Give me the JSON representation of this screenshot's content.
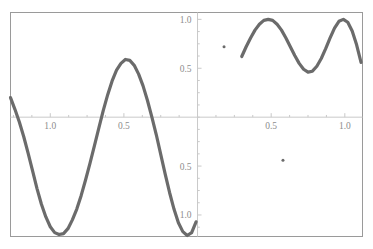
{
  "chart_data": {
    "type": "line",
    "title": "",
    "subtitle": "",
    "xlabel": "",
    "ylabel": "",
    "xlim": [
      -1.27,
      1.12
    ],
    "ylim": [
      -1.22,
      1.07
    ],
    "grid": false,
    "legend": null,
    "legend_position": "none",
    "axes": {
      "style": "cross-axes-inside-frame",
      "frame": true,
      "frame_color": "#9a9a9a",
      "axis_color": "#c9c9c9",
      "x_axis_value": 0,
      "y_axis_value": 0,
      "x_ticks": [
        -1.0,
        -0.5,
        0.5,
        1.0
      ],
      "x_tick_labels": [
        "1.0",
        "0.5",
        "0.5",
        "1.0"
      ],
      "y_ticks": [
        -1.0,
        -0.5,
        0.5,
        1.0
      ],
      "y_tick_labels": [
        "1.0",
        "0.5",
        "0.5",
        "1.0"
      ],
      "minor_ticks_per_interval": 4
    },
    "series": [
      {
        "name": "main-branch",
        "color": "#6b6b6b",
        "linewidth": 3.2,
        "x": [
          -1.27,
          -1.24,
          -1.21,
          -1.18,
          -1.15,
          -1.12,
          -1.09,
          -1.06,
          -1.03,
          -1.0,
          -0.97,
          -0.94,
          -0.91,
          -0.88,
          -0.85,
          -0.82,
          -0.79,
          -0.76,
          -0.73,
          -0.7,
          -0.67,
          -0.64,
          -0.61,
          -0.58,
          -0.55,
          -0.52,
          -0.49,
          -0.46,
          -0.43,
          -0.4,
          -0.37,
          -0.34,
          -0.31,
          -0.28,
          -0.25,
          -0.22,
          -0.19,
          -0.16,
          -0.13,
          -0.1,
          -0.07,
          -0.04,
          -0.01
        ],
        "y": [
          0.2,
          0.08,
          -0.05,
          -0.2,
          -0.37,
          -0.55,
          -0.73,
          -0.89,
          -1.02,
          -1.12,
          -1.18,
          -1.2,
          -1.19,
          -1.14,
          -1.05,
          -0.94,
          -0.8,
          -0.64,
          -0.47,
          -0.29,
          -0.11,
          0.07,
          0.23,
          0.37,
          0.48,
          0.55,
          0.59,
          0.58,
          0.53,
          0.44,
          0.32,
          0.17,
          0.0,
          -0.18,
          -0.38,
          -0.58,
          -0.77,
          -0.94,
          -1.08,
          -1.17,
          -1.21,
          -1.18,
          -1.07
        ]
      },
      {
        "name": "upper-right-branch",
        "color": "#6b6b6b",
        "linewidth": 3.2,
        "x": [
          0.3,
          0.33,
          0.36,
          0.39,
          0.42,
          0.45,
          0.48,
          0.51,
          0.54,
          0.57,
          0.6,
          0.63,
          0.66,
          0.69,
          0.72,
          0.75,
          0.78,
          0.81,
          0.84,
          0.87,
          0.9,
          0.93,
          0.96,
          0.99,
          1.02,
          1.05,
          1.08,
          1.11
        ],
        "y": [
          0.62,
          0.72,
          0.81,
          0.89,
          0.95,
          0.99,
          1.0,
          0.99,
          0.95,
          0.89,
          0.81,
          0.72,
          0.63,
          0.55,
          0.49,
          0.46,
          0.47,
          0.52,
          0.6,
          0.7,
          0.81,
          0.91,
          0.98,
          1.0,
          0.97,
          0.88,
          0.74,
          0.56
        ]
      }
    ],
    "points": [
      {
        "name": "isolated-point-1",
        "x": 0.18,
        "y": 0.72,
        "color": "#6b6b6b",
        "size": 3
      },
      {
        "name": "isolated-point-2",
        "x": 0.58,
        "y": -0.44,
        "color": "#6b6b6b",
        "size": 3
      }
    ]
  }
}
